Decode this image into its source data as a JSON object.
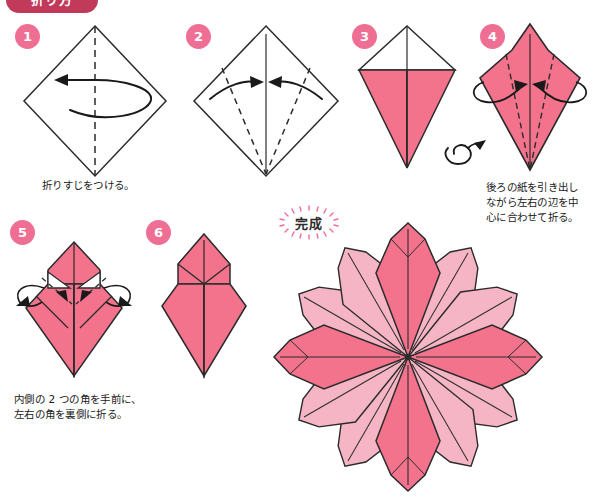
{
  "document": {
    "title": "折り方",
    "language": "ja",
    "type": "origami-instruction-diagram"
  },
  "banner": {
    "label": "折り方"
  },
  "colors": {
    "paper_front": "#f4738c",
    "paper_back": "#f5b5c4",
    "paper_white": "#ffffff",
    "outline": "#2b2b2b",
    "badge": "#ef6e94",
    "banner": "#c13a5a",
    "text": "#1a1a1a"
  },
  "steps": [
    {
      "number": "1",
      "badge_label": "1",
      "shape": "diamond-white",
      "caption": "折りすじをつける。",
      "fold_lines": "vertical-dashed-center",
      "arrows": "fold-and-unfold-left"
    },
    {
      "number": "2",
      "badge_label": "2",
      "shape": "diamond-white",
      "caption": "",
      "fold_lines": "two-diagonal-dashed",
      "arrows": "two-inward-arrows"
    },
    {
      "number": "3",
      "badge_label": "3",
      "shape": "kite-white-top-pink-bottom",
      "caption": "",
      "fold_lines": "vertical-center",
      "arrows": "none"
    },
    {
      "number": "4",
      "badge_label": "4",
      "shape": "kite-all-pink",
      "caption": "後ろの紙を引き出し\nながら左右の辺を中\n心に合わせて折る。",
      "fold_lines": "two-dashed-to-apex",
      "arrows": "two-curved-wrap-arrows",
      "symbol": "turn-over-loop"
    },
    {
      "number": "5",
      "badge_label": "5",
      "shape": "narrow-petal-with-white-flaps",
      "caption": "内側の 2 つの角を手前に、\n左右の角を裏側に折る。",
      "fold_lines": "dashed-corner-folds",
      "arrows": "inward-and-outward-arrows"
    },
    {
      "number": "6",
      "badge_label": "6",
      "shape": "finished-petal-unit",
      "caption": "",
      "fold_lines": "center-and-shoulder-creases",
      "arrows": "none"
    }
  ],
  "result": {
    "stamp_label": "完成",
    "stamp_style": "dotted-radial-burst",
    "model_name": "flower",
    "petal_count": 12,
    "alternating_colors": [
      "#f4738c",
      "#f5b5c4"
    ]
  },
  "captions": {
    "step1": "折りすじをつける。",
    "step4": "後ろの紙を引き出し\nながら左右の辺を中\n心に合わせて折る。",
    "step5": "内側の 2 つの角を手前に、\n左右の角を裏側に折る。"
  }
}
